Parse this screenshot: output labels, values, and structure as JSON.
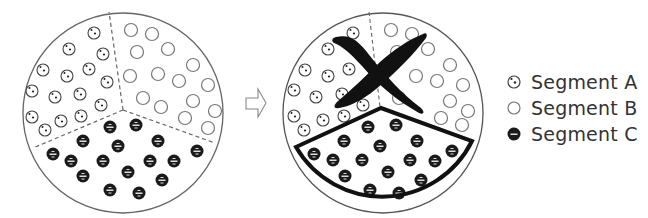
{
  "diagram": {
    "type": "before-after segmentation",
    "before": {
      "segments": [
        "Segment A",
        "Segment B",
        "Segment C"
      ],
      "counts": {
        "A": 19,
        "B": 16,
        "C": 18
      }
    },
    "arrow": "right-arrow",
    "after": {
      "crossed_out_region": "Segment A + Segment B",
      "highlighted_region": "Segment C"
    }
  },
  "legend": {
    "items": [
      {
        "label": "Segment A",
        "marker": "dotted-circle"
      },
      {
        "label": "Segment B",
        "marker": "open-circle"
      },
      {
        "label": "Segment C",
        "marker": "filled-circle"
      }
    ]
  },
  "colors": {
    "line": "#555555",
    "ink": "#111111",
    "dashed": "#666666"
  }
}
